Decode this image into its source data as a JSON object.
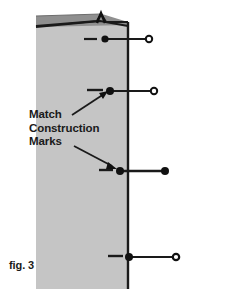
{
  "figure": {
    "caption": "fig. 3",
    "callout": {
      "line1": "Match",
      "line2": "Construction",
      "line3": "Marks"
    },
    "colors": {
      "background": "#ffffff",
      "panel_face": "#c5c5c5",
      "panel_fold": "#8f8f8f",
      "ink": "#1a1a1a"
    },
    "panel": {
      "left_x": 36,
      "right_x": 128,
      "top_y": 28,
      "bottom_y": 289,
      "fold_top_left_y": 16,
      "fold_top_right_y": 24,
      "notch_label": "alignment-notch"
    },
    "pins": [
      {
        "id": "pin-1",
        "tick_y": 39,
        "head_x": 105,
        "shaft_end_x": 150,
        "tip_style": "open-circle",
        "dash_from_x": 84,
        "dash_to_x": 97
      },
      {
        "id": "pin-2",
        "tick_y": 91,
        "head_x": 110,
        "shaft_end_x": 155,
        "tip_style": "open-circle",
        "dash_from_x": 87,
        "dash_to_x": 103
      },
      {
        "id": "pin-3",
        "tick_y": 171,
        "head_x": 120,
        "shaft_end_x": 166,
        "tip_style": "filled-circle",
        "dash_from_x": 99,
        "dash_to_x": 113
      },
      {
        "id": "pin-4",
        "tick_y": 257,
        "head_x": 129,
        "shaft_end_x": 177,
        "tip_style": "open-circle",
        "dash_from_x": 108,
        "dash_to_x": 123
      }
    ],
    "arrows": [
      {
        "id": "arrow-to-pin-2",
        "from_x": 72,
        "from_y": 114,
        "to_x": 108,
        "to_y": 92
      },
      {
        "id": "arrow-to-pin-3",
        "from_x": 75,
        "from_y": 146,
        "to_x": 117,
        "to_y": 169
      }
    ]
  }
}
